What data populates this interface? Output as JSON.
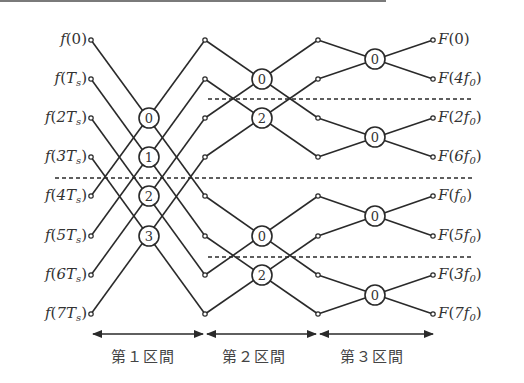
{
  "inputs": [
    "f(0)",
    "f(T_s)",
    "f(2T_s)",
    "f(3T_s)",
    "f(4T_s)",
    "f(5T_s)",
    "f(6T_s)",
    "f(7T_s)"
  ],
  "inputs_display": [
    {
      "fn": "f",
      "arg": "0",
      "sub": ""
    },
    {
      "fn": "f",
      "arg": "T",
      "sub": "s"
    },
    {
      "fn": "f",
      "arg": "2T",
      "sub": "s"
    },
    {
      "fn": "f",
      "arg": "3T",
      "sub": "s"
    },
    {
      "fn": "f",
      "arg": "4T",
      "sub": "s"
    },
    {
      "fn": "f",
      "arg": "5T",
      "sub": "s"
    },
    {
      "fn": "f",
      "arg": "6T",
      "sub": "s"
    },
    {
      "fn": "f",
      "arg": "7T",
      "sub": "s"
    }
  ],
  "outputs": [
    "F(0)",
    "F(4f_0)",
    "F(2f_0)",
    "F(6f_0)",
    "F(f_0)",
    "F(5f_0)",
    "F(3f_0)",
    "F(7f_0)"
  ],
  "outputs_display": [
    {
      "fn": "F",
      "arg": "0",
      "sub": ""
    },
    {
      "fn": "F",
      "arg": "4f",
      "sub": "0"
    },
    {
      "fn": "F",
      "arg": "2f",
      "sub": "0"
    },
    {
      "fn": "F",
      "arg": "6f",
      "sub": "0"
    },
    {
      "fn": "F",
      "arg": "f",
      "sub": "0"
    },
    {
      "fn": "F",
      "arg": "5f",
      "sub": "0"
    },
    {
      "fn": "F",
      "arg": "3f",
      "sub": "0"
    },
    {
      "fn": "F",
      "arg": "7f",
      "sub": "0"
    }
  ],
  "stages": [
    {
      "label": "第１区間",
      "twiddles": [
        "0",
        "1",
        "2",
        "3"
      ]
    },
    {
      "label": "第２区間",
      "twiddles": [
        "0",
        "2",
        "0",
        "2"
      ]
    },
    {
      "label": "第３区間",
      "twiddles": [
        "0",
        "0",
        "0",
        "0"
      ]
    }
  ],
  "colors": {
    "line": "#2a2a2a",
    "text": "#333333",
    "topbar": "#7a7a7a"
  }
}
